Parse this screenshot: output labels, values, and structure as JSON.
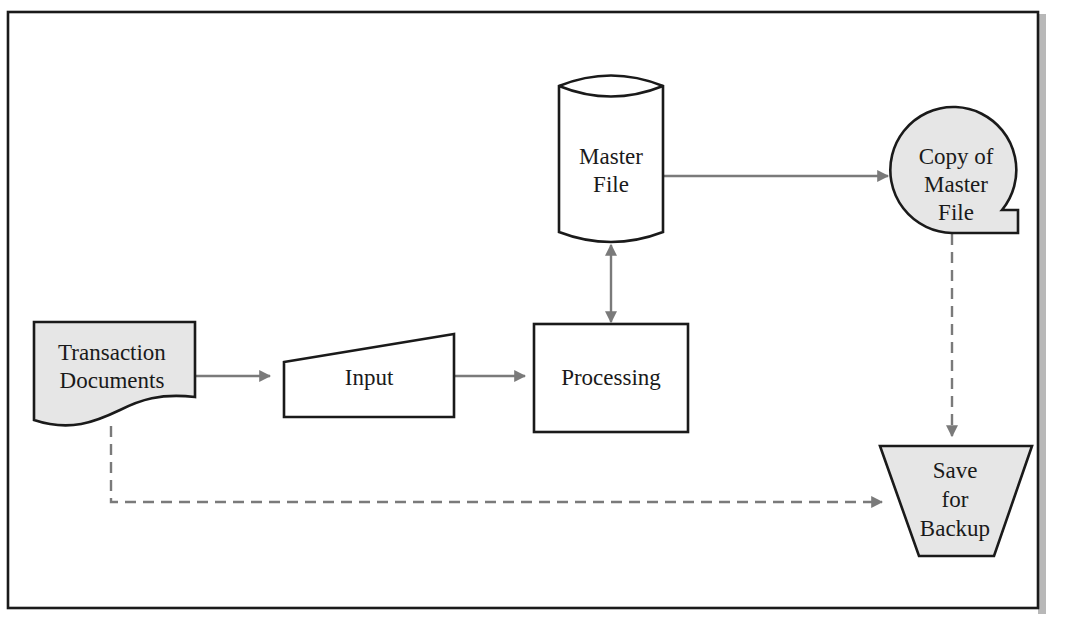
{
  "diagram": {
    "colors": {
      "background": "#ffffff",
      "frame": "#1a1a1a",
      "frame_shadow": "#b8b8b8",
      "shaded_fill": "#e6e6e6",
      "unshaded_fill": "#ffffff",
      "flow_line": "#7a7a7a"
    },
    "nodes": {
      "transaction_documents": {
        "type": "document",
        "shaded": true,
        "lines": [
          "Transaction",
          "Documents"
        ]
      },
      "input": {
        "type": "manual-input",
        "shaded": false,
        "lines": [
          "Input"
        ]
      },
      "processing": {
        "type": "process",
        "shaded": false,
        "lines": [
          "Processing"
        ]
      },
      "master_file": {
        "type": "magnetic-disk",
        "shaded": false,
        "lines": [
          "Master",
          "File"
        ]
      },
      "copy_of_master_file": {
        "type": "magnetic-tape",
        "shaded": true,
        "lines": [
          "Copy of",
          "Master",
          "File"
        ]
      },
      "save_for_backup": {
        "type": "offline-storage",
        "shaded": true,
        "lines": [
          "Save",
          "for",
          "Backup"
        ]
      }
    },
    "edges": [
      {
        "from": "transaction_documents",
        "to": "input",
        "style": "solid"
      },
      {
        "from": "input",
        "to": "processing",
        "style": "solid"
      },
      {
        "from": "processing",
        "to": "master_file",
        "style": "solid",
        "bidirectional": true
      },
      {
        "from": "master_file",
        "to": "copy_of_master_file",
        "style": "solid"
      },
      {
        "from": "copy_of_master_file",
        "to": "save_for_backup",
        "style": "dashed"
      },
      {
        "from": "transaction_documents",
        "to": "save_for_backup",
        "style": "dashed"
      }
    ]
  }
}
